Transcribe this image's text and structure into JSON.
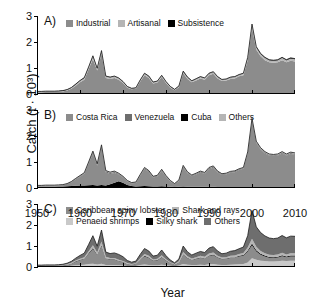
{
  "figure": {
    "ylabel": "Catch (t · 10³)",
    "xlabel": "Year",
    "yticks": [
      "0",
      "1",
      "2",
      "3"
    ],
    "xticks": [
      "1950",
      "1960",
      "1970",
      "1980",
      "1990",
      "2000",
      "2010"
    ]
  },
  "colors": {
    "dark_gray": "#6e6e6e",
    "mid_gray": "#8c8c8c",
    "light_gray": "#b5b5b5",
    "lighter_gray": "#c9c9c9",
    "black": "#000000",
    "axis": "#000000",
    "background": "#ffffff"
  },
  "panels": {
    "a": {
      "tag": "A)",
      "legend": [
        {
          "label": "Industrial",
          "color": "#8c8c8c"
        },
        {
          "label": "Artisanal",
          "color": "#b5b5b5"
        },
        {
          "label": "Subsistence",
          "color": "#000000"
        }
      ]
    },
    "b": {
      "tag": "B)",
      "legend": [
        {
          "label": "Costa Rica",
          "color": "#8c8c8c"
        },
        {
          "label": "Venezuela",
          "color": "#6e6e6e"
        },
        {
          "label": "Cuba",
          "color": "#000000"
        },
        {
          "label": "Others",
          "color": "#b5b5b5"
        }
      ]
    },
    "c": {
      "tag": "C)",
      "legend": [
        {
          "label": "Caribbean spiny lobster",
          "color": "#8c8c8c"
        },
        {
          "label": "Shark and rays",
          "color": "#b5b5b5"
        },
        {
          "label": "Penaeid shrimps",
          "color": "#c9c9c9"
        },
        {
          "label": "Silky shark",
          "color": "#000000"
        },
        {
          "label": "Others",
          "color": "#6e6e6e"
        }
      ]
    }
  },
  "chart_data": {
    "type": "area",
    "title": "",
    "xlabel": "Year",
    "ylabel": "Catch (t · 10³)",
    "xlim": [
      1950,
      2010
    ],
    "ylim": [
      0,
      3
    ],
    "grid": false,
    "legend_position": "inside-top-left",
    "stacked": true,
    "x": [
      1950,
      1951,
      1952,
      1953,
      1954,
      1955,
      1956,
      1957,
      1958,
      1959,
      1960,
      1961,
      1962,
      1963,
      1964,
      1965,
      1966,
      1967,
      1968,
      1969,
      1970,
      1971,
      1972,
      1973,
      1974,
      1975,
      1976,
      1977,
      1978,
      1979,
      1980,
      1981,
      1982,
      1983,
      1984,
      1985,
      1986,
      1987,
      1988,
      1989,
      1990,
      1991,
      1992,
      1993,
      1994,
      1995,
      1996,
      1997,
      1998,
      1999,
      2000,
      2001,
      2002,
      2003,
      2004,
      2005,
      2006,
      2007,
      2008,
      2009,
      2010
    ],
    "panels": [
      {
        "id": "A",
        "label": "A)",
        "series": [
          {
            "name": "Industrial",
            "color": "#8c8c8c",
            "values": [
              0.07,
              0.07,
              0.08,
              0.08,
              0.08,
              0.09,
              0.1,
              0.13,
              0.2,
              0.32,
              0.45,
              0.55,
              0.95,
              1.35,
              0.9,
              1.55,
              0.62,
              0.58,
              0.62,
              0.55,
              0.42,
              0.24,
              0.18,
              0.2,
              0.48,
              0.72,
              0.62,
              0.4,
              0.44,
              0.65,
              0.42,
              0.24,
              0.14,
              0.26,
              0.8,
              0.58,
              0.45,
              0.52,
              0.6,
              0.55,
              0.72,
              0.78,
              0.6,
              0.5,
              0.52,
              0.58,
              0.6,
              0.68,
              0.72,
              1.3,
              2.55,
              1.7,
              1.45,
              1.3,
              1.22,
              1.2,
              1.22,
              1.3,
              1.22,
              1.28,
              1.25
            ]
          },
          {
            "name": "Artisanal",
            "color": "#b5b5b5",
            "values": [
              0.02,
              0.02,
              0.02,
              0.02,
              0.02,
              0.02,
              0.02,
              0.03,
              0.04,
              0.05,
              0.06,
              0.07,
              0.08,
              0.1,
              0.08,
              0.1,
              0.06,
              0.06,
              0.06,
              0.06,
              0.05,
              0.04,
              0.03,
              0.03,
              0.05,
              0.07,
              0.06,
              0.05,
              0.05,
              0.06,
              0.05,
              0.04,
              0.03,
              0.04,
              0.07,
              0.06,
              0.05,
              0.06,
              0.06,
              0.06,
              0.07,
              0.07,
              0.06,
              0.05,
              0.05,
              0.06,
              0.06,
              0.06,
              0.07,
              0.09,
              0.12,
              0.1,
              0.09,
              0.09,
              0.08,
              0.08,
              0.08,
              0.09,
              0.08,
              0.09,
              0.09
            ]
          },
          {
            "name": "Subsistence",
            "color": "#000000",
            "values": [
              0.01,
              0.01,
              0.01,
              0.01,
              0.01,
              0.01,
              0.01,
              0.01,
              0.01,
              0.01,
              0.01,
              0.01,
              0.01,
              0.02,
              0.01,
              0.02,
              0.01,
              0.01,
              0.01,
              0.01,
              0.01,
              0.01,
              0.01,
              0.01,
              0.01,
              0.01,
              0.01,
              0.01,
              0.01,
              0.01,
              0.01,
              0.01,
              0.01,
              0.01,
              0.01,
              0.01,
              0.01,
              0.01,
              0.01,
              0.01,
              0.01,
              0.01,
              0.01,
              0.01,
              0.01,
              0.01,
              0.01,
              0.01,
              0.01,
              0.02,
              0.02,
              0.02,
              0.02,
              0.02,
              0.02,
              0.02,
              0.02,
              0.02,
              0.02,
              0.02,
              0.02
            ]
          }
        ]
      },
      {
        "id": "B",
        "label": "B)",
        "series": [
          {
            "name": "Cuba",
            "color": "#000000",
            "values": [
              0.05,
              0.05,
              0.05,
              0.05,
              0.05,
              0.06,
              0.06,
              0.07,
              0.08,
              0.09,
              0.1,
              0.1,
              0.11,
              0.12,
              0.1,
              0.12,
              0.1,
              0.14,
              0.2,
              0.26,
              0.2,
              0.12,
              0.08,
              0.06,
              0.07,
              0.08,
              0.07,
              0.06,
              0.06,
              0.07,
              0.06,
              0.05,
              0.04,
              0.05,
              0.06,
              0.05,
              0.05,
              0.05,
              0.05,
              0.05,
              0.05,
              0.05,
              0.04,
              0.04,
              0.04,
              0.04,
              0.04,
              0.04,
              0.04,
              0.04,
              0.04,
              0.03,
              0.03,
              0.03,
              0.03,
              0.03,
              0.03,
              0.03,
              0.03,
              0.03,
              0.03
            ]
          },
          {
            "name": "Costa Rica",
            "color": "#8c8c8c",
            "values": [
              0.03,
              0.03,
              0.04,
              0.04,
              0.04,
              0.04,
              0.05,
              0.08,
              0.14,
              0.25,
              0.33,
              0.44,
              0.82,
              1.2,
              0.76,
              1.44,
              0.5,
              0.4,
              0.38,
              0.26,
              0.2,
              0.13,
              0.1,
              0.13,
              0.4,
              0.64,
              0.55,
              0.34,
              0.38,
              0.58,
              0.37,
              0.2,
              0.1,
              0.22,
              0.74,
              0.52,
              0.4,
              0.47,
              0.55,
              0.5,
              0.67,
              0.73,
              0.56,
              0.46,
              0.48,
              0.55,
              0.57,
              0.65,
              0.7,
              1.28,
              2.55,
              1.7,
              1.45,
              1.3,
              1.22,
              1.2,
              1.22,
              1.3,
              1.22,
              1.28,
              1.25
            ]
          },
          {
            "name": "Venezuela",
            "color": "#6e6e6e",
            "values": [
              0.01,
              0.01,
              0.01,
              0.01,
              0.01,
              0.01,
              0.01,
              0.01,
              0.02,
              0.02,
              0.03,
              0.03,
              0.04,
              0.06,
              0.04,
              0.06,
              0.04,
              0.04,
              0.04,
              0.03,
              0.03,
              0.02,
              0.02,
              0.02,
              0.03,
              0.04,
              0.03,
              0.03,
              0.03,
              0.04,
              0.03,
              0.02,
              0.02,
              0.02,
              0.04,
              0.03,
              0.03,
              0.03,
              0.03,
              0.03,
              0.04,
              0.04,
              0.03,
              0.03,
              0.03,
              0.03,
              0.03,
              0.03,
              0.03,
              0.04,
              0.05,
              0.04,
              0.04,
              0.04,
              0.03,
              0.03,
              0.03,
              0.04,
              0.03,
              0.04,
              0.04
            ]
          },
          {
            "name": "Others",
            "color": "#b5b5b5",
            "values": [
              0.01,
              0.01,
              0.01,
              0.01,
              0.01,
              0.01,
              0.01,
              0.01,
              0.01,
              0.01,
              0.02,
              0.02,
              0.03,
              0.04,
              0.03,
              0.04,
              0.03,
              0.03,
              0.03,
              0.02,
              0.02,
              0.02,
              0.01,
              0.02,
              0.02,
              0.03,
              0.02,
              0.02,
              0.02,
              0.03,
              0.02,
              0.02,
              0.01,
              0.02,
              0.03,
              0.02,
              0.02,
              0.02,
              0.02,
              0.02,
              0.03,
              0.03,
              0.02,
              0.02,
              0.02,
              0.02,
              0.02,
              0.02,
              0.02,
              0.03,
              0.04,
              0.03,
              0.03,
              0.03,
              0.03,
              0.03,
              0.03,
              0.03,
              0.03,
              0.03,
              0.03
            ]
          }
        ]
      },
      {
        "id": "C",
        "label": "C)",
        "series": [
          {
            "name": "Penaeid shrimps",
            "color": "#c9c9c9",
            "values": [
              0.02,
              0.02,
              0.02,
              0.02,
              0.02,
              0.02,
              0.03,
              0.04,
              0.06,
              0.08,
              0.1,
              0.11,
              0.14,
              0.16,
              0.12,
              0.16,
              0.1,
              0.09,
              0.09,
              0.08,
              0.07,
              0.05,
              0.04,
              0.05,
              0.09,
              0.12,
              0.1,
              0.08,
              0.08,
              0.11,
              0.08,
              0.06,
              0.04,
              0.07,
              0.14,
              0.11,
              0.09,
              0.1,
              0.11,
              0.1,
              0.13,
              0.14,
              0.11,
              0.1,
              0.1,
              0.11,
              0.12,
              0.13,
              0.14,
              0.22,
              0.42,
              0.34,
              0.3,
              0.28,
              0.26,
              0.26,
              0.27,
              0.3,
              0.28,
              0.3,
              0.3
            ]
          },
          {
            "name": "Caribbean spiny lobster",
            "color": "#8c8c8c",
            "values": [
              0.03,
              0.03,
              0.03,
              0.03,
              0.03,
              0.04,
              0.04,
              0.06,
              0.1,
              0.17,
              0.22,
              0.28,
              0.48,
              0.7,
              0.45,
              0.84,
              0.3,
              0.26,
              0.26,
              0.2,
              0.16,
              0.1,
              0.07,
              0.09,
              0.25,
              0.38,
              0.33,
              0.21,
              0.23,
              0.34,
              0.22,
              0.13,
              0.07,
              0.14,
              0.44,
              0.31,
              0.24,
              0.28,
              0.32,
              0.3,
              0.39,
              0.42,
              0.33,
              0.27,
              0.28,
              0.32,
              0.33,
              0.37,
              0.4,
              0.52,
              0.62,
              0.4,
              0.28,
              0.22,
              0.18,
              0.17,
              0.18,
              0.21,
              0.18,
              0.2,
              0.2
            ]
          },
          {
            "name": "Silky shark",
            "color": "#000000",
            "values": [
              0.01,
              0.01,
              0.01,
              0.01,
              0.01,
              0.01,
              0.01,
              0.01,
              0.01,
              0.02,
              0.02,
              0.02,
              0.03,
              0.04,
              0.03,
              0.04,
              0.02,
              0.02,
              0.02,
              0.02,
              0.02,
              0.01,
              0.01,
              0.01,
              0.02,
              0.03,
              0.02,
              0.02,
              0.02,
              0.03,
              0.02,
              0.01,
              0.01,
              0.02,
              0.03,
              0.02,
              0.02,
              0.02,
              0.02,
              0.02,
              0.03,
              0.03,
              0.02,
              0.02,
              0.02,
              0.02,
              0.02,
              0.03,
              0.03,
              0.05,
              0.08,
              0.06,
              0.05,
              0.05,
              0.04,
              0.04,
              0.04,
              0.05,
              0.04,
              0.05,
              0.05
            ]
          },
          {
            "name": "Shark and rays",
            "color": "#b5b5b5",
            "values": [
              0.01,
              0.01,
              0.01,
              0.01,
              0.01,
              0.01,
              0.01,
              0.02,
              0.03,
              0.04,
              0.05,
              0.06,
              0.1,
              0.14,
              0.09,
              0.17,
              0.07,
              0.06,
              0.06,
              0.05,
              0.04,
              0.03,
              0.02,
              0.03,
              0.06,
              0.09,
              0.08,
              0.05,
              0.06,
              0.08,
              0.05,
              0.03,
              0.02,
              0.04,
              0.1,
              0.07,
              0.06,
              0.07,
              0.08,
              0.07,
              0.09,
              0.1,
              0.08,
              0.06,
              0.07,
              0.08,
              0.08,
              0.09,
              0.1,
              0.14,
              0.22,
              0.16,
              0.13,
              0.11,
              0.1,
              0.1,
              0.1,
              0.12,
              0.1,
              0.11,
              0.11
            ]
          },
          {
            "name": "Others",
            "color": "#6e6e6e",
            "values": [
              0.02,
              0.02,
              0.03,
              0.03,
              0.03,
              0.03,
              0.04,
              0.05,
              0.07,
              0.11,
              0.16,
              0.19,
              0.32,
              0.45,
              0.3,
              0.55,
              0.22,
              0.21,
              0.24,
              0.25,
              0.2,
              0.12,
              0.09,
              0.1,
              0.18,
              0.26,
              0.23,
              0.16,
              0.17,
              0.25,
              0.17,
              0.1,
              0.06,
              0.11,
              0.29,
              0.21,
              0.16,
              0.19,
              0.21,
              0.2,
              0.26,
              0.28,
              0.22,
              0.18,
              0.19,
              0.22,
              0.23,
              0.25,
              0.28,
              0.56,
              1.35,
              0.95,
              0.88,
              0.82,
              0.8,
              0.78,
              0.79,
              0.82,
              0.79,
              0.81,
              0.8
            ]
          }
        ]
      }
    ]
  }
}
